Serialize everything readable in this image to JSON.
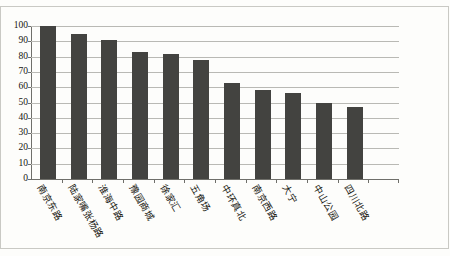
{
  "chart_data": {
    "type": "bar",
    "title": "",
    "xlabel": "",
    "ylabel": "",
    "ylim": [
      0,
      100
    ],
    "ytick_step": 10,
    "grid": true,
    "legend": "none",
    "bar_color": "#434340",
    "categories": [
      "南京东路",
      "陆家嘴张杨路",
      "淮海中路",
      "豫园商城",
      "徐家汇",
      "五角场",
      "中环真北",
      "南京西路",
      "大宁",
      "中山公园",
      "四川北路"
    ],
    "values": [
      100,
      95,
      91,
      83,
      82,
      78,
      63,
      58,
      56,
      50,
      47
    ],
    "ytick_labels": [
      "100",
      "90",
      "80",
      "70",
      "60",
      "50",
      "40",
      "30",
      "20",
      "10",
      "0"
    ]
  }
}
